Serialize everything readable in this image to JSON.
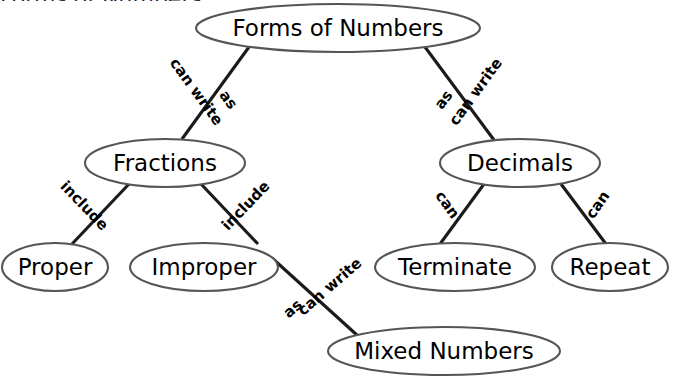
{
  "document": {
    "title": "Forms of Numbers",
    "cut_off_heading": "Forms of Numbers.",
    "background_color": "#ffffff",
    "node_stroke_color": "#555555",
    "edge_stroke_color": "#1a1a1a",
    "text_color": "#000000"
  },
  "nodes": [
    {
      "id": "forms",
      "label": "Forms of Numbers",
      "cx": 338,
      "cy": 28,
      "rx": 142,
      "ry": 24,
      "font_size": 24
    },
    {
      "id": "fractions",
      "label": "Fractions",
      "cx": 165,
      "cy": 163,
      "rx": 80,
      "ry": 24,
      "font_size": 23
    },
    {
      "id": "decimals",
      "label": "Decimals",
      "cx": 520,
      "cy": 163,
      "rx": 80,
      "ry": 24,
      "font_size": 23
    },
    {
      "id": "proper",
      "label": "Proper",
      "cx": 55,
      "cy": 267,
      "rx": 53,
      "ry": 24,
      "font_size": 23
    },
    {
      "id": "improper",
      "label": "Improper",
      "cx": 204,
      "cy": 267,
      "rx": 74,
      "ry": 24,
      "font_size": 23
    },
    {
      "id": "terminate",
      "label": "Terminate",
      "cx": 455,
      "cy": 267,
      "rx": 80,
      "ry": 24,
      "font_size": 23
    },
    {
      "id": "repeat",
      "label": "Repeat",
      "cx": 610,
      "cy": 267,
      "rx": 58,
      "ry": 24,
      "font_size": 23
    },
    {
      "id": "mixed",
      "label": "Mixed Numbers",
      "cx": 444,
      "cy": 351,
      "rx": 116,
      "ry": 24,
      "font_size": 24
    }
  ],
  "edges": [
    {
      "id": "forms-fractions",
      "from": "forms",
      "to": "fractions",
      "x1": 249,
      "y1": 47,
      "x2": 182,
      "y2": 139,
      "labels": [
        {
          "text": "can write",
          "x": 196,
          "y": 92,
          "rotate": 54
        },
        {
          "text": "as",
          "x": 228,
          "y": 100,
          "rotate": 54
        }
      ]
    },
    {
      "id": "forms-decimals",
      "from": "forms",
      "to": "decimals",
      "x1": 425,
      "y1": 47,
      "x2": 494,
      "y2": 140,
      "labels": [
        {
          "text": "can write",
          "x": 476,
          "y": 92,
          "rotate": -54
        },
        {
          "text": "as",
          "x": 444,
          "y": 100,
          "rotate": -54
        }
      ]
    },
    {
      "id": "fractions-proper",
      "from": "fractions",
      "to": "proper",
      "x1": 129,
      "y1": 184,
      "x2": 72,
      "y2": 244,
      "labels": [
        {
          "text": "include",
          "x": 84,
          "y": 206,
          "rotate": 46
        }
      ]
    },
    {
      "id": "fractions-improper",
      "from": "fractions",
      "to": "improper",
      "x1": 201,
      "y1": 184,
      "x2": 258,
      "y2": 244,
      "labels": [
        {
          "text": "include",
          "x": 246,
          "y": 206,
          "rotate": -46
        }
      ]
    },
    {
      "id": "decimals-terminate",
      "from": "decimals",
      "to": "terminate",
      "x1": 484,
      "y1": 184,
      "x2": 440,
      "y2": 244,
      "labels": [
        {
          "text": "can",
          "x": 447,
          "y": 205,
          "rotate": 55
        }
      ]
    },
    {
      "id": "decimals-repeat",
      "from": "decimals",
      "to": "repeat",
      "x1": 561,
      "y1": 184,
      "x2": 606,
      "y2": 244,
      "labels": [
        {
          "text": "can",
          "x": 598,
          "y": 205,
          "rotate": -55
        }
      ]
    },
    {
      "id": "improper-mixed",
      "from": "improper",
      "to": "mixed",
      "x1": 272,
      "y1": 258,
      "x2": 358,
      "y2": 336,
      "labels": [
        {
          "text": "can write",
          "x": 330,
          "y": 287,
          "rotate": -41
        },
        {
          "text": "as",
          "x": 293,
          "y": 309,
          "rotate": -41
        }
      ]
    }
  ]
}
